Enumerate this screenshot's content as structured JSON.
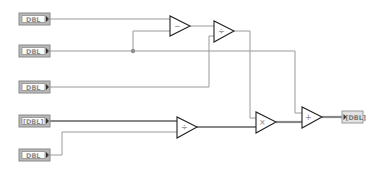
{
  "diagram": {
    "type": "LabVIEW block diagram",
    "controls": [
      {
        "id": "ctl1",
        "label": "DBL",
        "kind": "scalar"
      },
      {
        "id": "ctl2",
        "label": "DBL",
        "kind": "scalar"
      },
      {
        "id": "ctl3",
        "label": "DBL",
        "kind": "scalar"
      },
      {
        "id": "ctl4",
        "label": "[DBL]",
        "kind": "array"
      },
      {
        "id": "ctl5",
        "label": "DBL",
        "kind": "scalar"
      }
    ],
    "nodes": [
      {
        "id": "subtract",
        "symbol": "−",
        "op": "subtract"
      },
      {
        "id": "divide_top",
        "symbol": "÷",
        "op": "divide"
      },
      {
        "id": "divide_bottom",
        "symbol": "÷",
        "op": "divide"
      },
      {
        "id": "multiply",
        "symbol": "×",
        "op": "multiply"
      },
      {
        "id": "add",
        "symbol": "+",
        "op": "add"
      }
    ],
    "indicator": {
      "id": "ind1",
      "label": "[DBL]",
      "kind": "array"
    },
    "connections": [
      [
        "ctl1",
        "subtract.x"
      ],
      [
        "ctl2",
        "subtract.y"
      ],
      [
        "ctl2",
        "add.x"
      ],
      [
        "subtract",
        "divide_top.x"
      ],
      [
        "ctl3",
        "divide_top.y"
      ],
      [
        "ctl4",
        "divide_bottom.x"
      ],
      [
        "ctl5",
        "divide_bottom.y"
      ],
      [
        "divide_top",
        "multiply.x"
      ],
      [
        "divide_bottom",
        "multiply.y"
      ],
      [
        "multiply",
        "add.y"
      ],
      [
        "add",
        "ind1"
      ]
    ]
  }
}
